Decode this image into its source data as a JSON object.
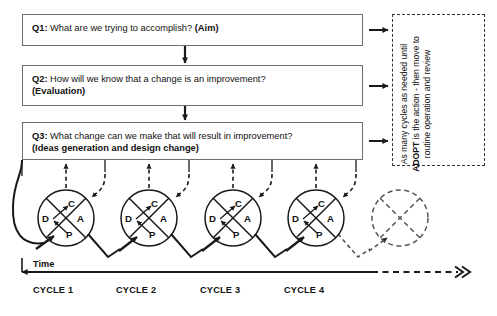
{
  "diagram": {
    "title_absent": true,
    "questions": [
      {
        "id": "q1",
        "label": "Q1:",
        "text": " What are we trying to accomplish? ",
        "bold_tail": "(Aim)",
        "line2": ""
      },
      {
        "id": "q2",
        "label": "Q2:",
        "text": " How will we know that a change is an improvement?",
        "bold_tail": "",
        "line2": "(Evaluation)"
      },
      {
        "id": "q3",
        "label": "Q3:",
        "text": " What change can we make that will result in improvement?",
        "bold_tail": "",
        "line2": "(Ideas generation and design change)"
      }
    ],
    "side_note": {
      "text_before": "As many cycles as needed until ",
      "emphasis": "ADOPT",
      "text_after": " is the action - then move to routine operation and review"
    },
    "timeline": {
      "axis_label": "Time",
      "cycle_labels": [
        "CYCLE 1",
        "CYCLE 2",
        "CYCLE 3",
        "CYCLE 4"
      ],
      "continuation_marker": ">>"
    },
    "pdsa_cycles": [
      {
        "name": "cycle-1",
        "cx": 66,
        "cy": 218,
        "r": 28,
        "style": "solid",
        "letters": {
          "C": "C",
          "A": "A",
          "P": "P",
          "D": "D"
        }
      },
      {
        "name": "cycle-2",
        "cx": 149,
        "cy": 218,
        "r": 28,
        "style": "solid",
        "letters": {
          "C": "C",
          "A": "A",
          "P": "P",
          "D": "D"
        }
      },
      {
        "name": "cycle-3",
        "cx": 233,
        "cy": 218,
        "r": 28,
        "style": "solid",
        "letters": {
          "C": "C",
          "A": "A",
          "P": "P",
          "D": "D"
        }
      },
      {
        "name": "cycle-4",
        "cx": 316,
        "cy": 218,
        "r": 28,
        "style": "solid",
        "letters": {
          "C": "C",
          "A": "A",
          "P": "P",
          "D": "D"
        }
      },
      {
        "name": "cycle-next",
        "cx": 400,
        "cy": 218,
        "r": 28,
        "style": "dashed",
        "letters": {
          "C": "",
          "A": "",
          "P": "",
          "D": ""
        }
      }
    ],
    "colors": {
      "box_border": "#6e6e6e",
      "stroke": "#1a1a1a",
      "text": "#111111",
      "background": "#ffffff"
    }
  }
}
